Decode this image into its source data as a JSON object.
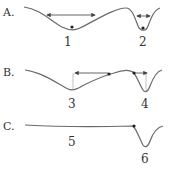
{
  "diagram": {
    "type": "potential-well-comparison",
    "panels": [
      {
        "id": "A",
        "label": "A.",
        "wells": [
          {
            "number": "1",
            "shape": "wide shallow well",
            "has_ball": true,
            "arrow": "double-headed, wide"
          },
          {
            "number": "2",
            "shape": "narrow deep well",
            "has_ball": true,
            "arrow": "double-headed, narrow"
          }
        ]
      },
      {
        "id": "B",
        "label": "B.",
        "wells": [
          {
            "number": "3",
            "shape": "wide shallow well",
            "has_ball": true,
            "arrow": "single-headed pointing left, with vertical guide to well bottom"
          },
          {
            "number": "4",
            "shape": "narrow deep well",
            "has_ball": true,
            "arrow": "single-headed pointing right, with vertical guide to well bottom"
          }
        ]
      },
      {
        "id": "C",
        "label": "C.",
        "wells": [
          {
            "number": "5",
            "shape": "nearly flat line",
            "has_ball": false
          },
          {
            "number": "6",
            "shape": "narrow deep well",
            "has_ball": true
          }
        ]
      }
    ],
    "colors": {
      "curve": "#6a6a6a",
      "arrow": "#555555",
      "dot": "#222222",
      "text": "#333333"
    }
  }
}
